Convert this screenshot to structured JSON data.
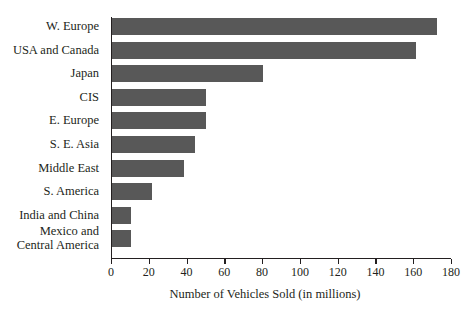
{
  "chart_data": {
    "type": "bar",
    "orientation": "horizontal",
    "title": "",
    "xlabel": "Number of Vehicles Sold (in millions)",
    "ylabel": "",
    "categories": [
      "W. Europe",
      "USA and Canada",
      "Japan",
      "CIS",
      "E. Europe",
      "S. E. Asia",
      "Middle East",
      "S. America",
      "India and China",
      "Mexico and\nCentral America"
    ],
    "values": [
      172,
      161,
      80,
      50,
      50,
      44,
      38,
      21,
      10,
      10
    ],
    "xlim": [
      0,
      180
    ],
    "xticks": [
      0,
      20,
      40,
      60,
      80,
      100,
      120,
      140,
      160,
      180
    ],
    "xtick_labels": [
      "0",
      "20",
      "40",
      "60",
      "80",
      "100",
      "120",
      "140",
      "160",
      "180"
    ],
    "grid": false,
    "legend": null,
    "bar_color": "#585858",
    "axis_color": "#231f20"
  }
}
